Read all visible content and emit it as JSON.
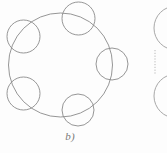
{
  "figure": {
    "caption": "b)",
    "background_color": "#fdfdfd",
    "stroke_color": "#8a8a8a",
    "stroke_color_light": "#9e9e9e",
    "stroke_width": 0.9,
    "main_circle": {
      "name": "large-ring",
      "cx": 60.5,
      "cy": 65,
      "r": 52
    },
    "node_circles": [
      {
        "name": "node-top",
        "cx": 78.5,
        "cy": 18.5,
        "r": 16.5
      },
      {
        "name": "node-upper-left",
        "cx": 23.5,
        "cy": 36.5,
        "r": 16.5
      },
      {
        "name": "node-lower-left",
        "cx": 23.5,
        "cy": 93.5,
        "r": 16.5
      },
      {
        "name": "node-bottom",
        "cx": 78,
        "cy": 110,
        "r": 16
      },
      {
        "name": "node-right",
        "cx": 112,
        "cy": 64,
        "r": 16
      }
    ],
    "partial_figure": {
      "name": "adjacent-figure-clipped",
      "note": "cropped neighbouring panel at right edge",
      "arc_top": {
        "cx": 176,
        "cy": 28,
        "r": 22
      },
      "arc_bottom": {
        "cx": 176,
        "cy": 96,
        "r": 22
      },
      "dotted_line": {
        "x": 155,
        "y1": 50,
        "y2": 74
      }
    }
  }
}
